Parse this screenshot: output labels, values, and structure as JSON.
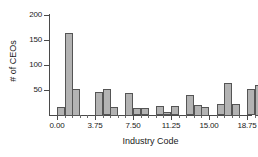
{
  "chart_data": {
    "type": "bar",
    "title": "",
    "xlabel": "Industry Code",
    "ylabel": "# of CEOs",
    "xlim": [
      0,
      20.25
    ],
    "ylim": [
      0,
      200
    ],
    "grid": false,
    "legend": null,
    "bin_width": 0.75,
    "x_ticks": [
      {
        "value": 0.0,
        "label": "0.00"
      },
      {
        "value": 3.75,
        "label": "3.75"
      },
      {
        "value": 7.5,
        "label": "7.50"
      },
      {
        "value": 11.25,
        "label": "11.25"
      },
      {
        "value": 15.0,
        "label": "15.00"
      },
      {
        "value": 18.75,
        "label": "18.75"
      }
    ],
    "y_ticks": [
      {
        "value": 50,
        "label": "50"
      },
      {
        "value": 100,
        "label": "100"
      },
      {
        "value": 150,
        "label": "150"
      },
      {
        "value": 200,
        "label": "200"
      }
    ],
    "x_minor_ticks": [
      0.75,
      1.5,
      2.25,
      3.0,
      4.5,
      5.25,
      6.0,
      6.75,
      8.25,
      9.0,
      9.75,
      10.5,
      12.0,
      12.75,
      13.5,
      14.25,
      15.75,
      16.5,
      17.25,
      18.0,
      19.5,
      20.25
    ],
    "bars": [
      {
        "bin_start": 0.0,
        "value": 17
      },
      {
        "bin_start": 0.75,
        "value": 165
      },
      {
        "bin_start": 1.5,
        "value": 53
      },
      {
        "bin_start": 3.75,
        "value": 47
      },
      {
        "bin_start": 4.5,
        "value": 52
      },
      {
        "bin_start": 5.25,
        "value": 17
      },
      {
        "bin_start": 6.75,
        "value": 45
      },
      {
        "bin_start": 7.5,
        "value": 14
      },
      {
        "bin_start": 8.25,
        "value": 14
      },
      {
        "bin_start": 9.75,
        "value": 18
      },
      {
        "bin_start": 10.5,
        "value": 6
      },
      {
        "bin_start": 11.25,
        "value": 18
      },
      {
        "bin_start": 12.75,
        "value": 40
      },
      {
        "bin_start": 13.5,
        "value": 21
      },
      {
        "bin_start": 14.25,
        "value": 17
      },
      {
        "bin_start": 15.75,
        "value": 22
      },
      {
        "bin_start": 16.5,
        "value": 65
      },
      {
        "bin_start": 17.25,
        "value": 23
      },
      {
        "bin_start": 18.75,
        "value": 52
      },
      {
        "bin_start": 19.5,
        "value": 61
      }
    ],
    "colors": {
      "bar_fill": "#b3b3b3",
      "bar_edge": "#555555",
      "axis": "#4a4a4a",
      "text": "#1a1a1a",
      "background": "#ffffff"
    }
  }
}
